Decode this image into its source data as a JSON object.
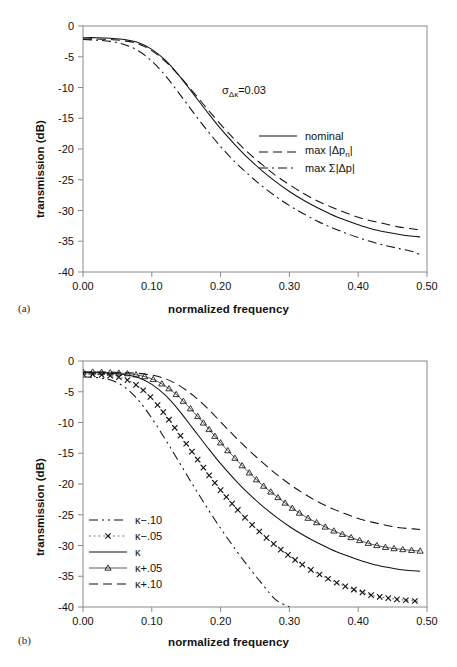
{
  "figure": {
    "panels": [
      {
        "id": "a",
        "panel_label": "(a)",
        "annotation_text": "=0.03",
        "annotation_symbol": "σ",
        "annotation_subscript": "Δκ"
      },
      {
        "id": "b",
        "panel_label": "(b)"
      }
    ]
  },
  "chart_data": [
    {
      "type": "line",
      "panel": "(a)",
      "title": "",
      "xlabel": "normalized frequency",
      "ylabel": "transmission (dB)",
      "xlim": [
        0.0,
        0.5
      ],
      "ylim": [
        -40,
        0
      ],
      "xticks": [
        "0.00",
        "0.10",
        "0.20",
        "0.30",
        "0.40",
        "0.50"
      ],
      "xtick_values": [
        0.0,
        0.1,
        0.2,
        0.3,
        0.4,
        0.5
      ],
      "yticks": [
        "0",
        "-5",
        "-10",
        "-15",
        "-20",
        "-25",
        "-30",
        "-35",
        "-40"
      ],
      "ytick_values": [
        0,
        -5,
        -10,
        -15,
        -20,
        -25,
        -30,
        -35,
        -40
      ],
      "grid": false,
      "legend_position": "center-right",
      "annotations": [
        {
          "text": "σΔκ=0.03",
          "x": 0.27,
          "y": -11.5
        }
      ],
      "x": [
        0.0,
        0.02,
        0.04,
        0.06,
        0.08,
        0.1,
        0.12,
        0.14,
        0.16,
        0.18,
        0.2,
        0.22,
        0.24,
        0.26,
        0.28,
        0.3,
        0.32,
        0.34,
        0.36,
        0.38,
        0.4,
        0.42,
        0.44,
        0.46,
        0.48,
        0.49
      ],
      "series": [
        {
          "name": "nominal",
          "style": "solid",
          "values": [
            -1.9,
            -1.9,
            -2.0,
            -2.2,
            -2.7,
            -3.8,
            -5.6,
            -8.1,
            -11.0,
            -13.9,
            -16.7,
            -19.2,
            -21.5,
            -23.5,
            -25.3,
            -26.9,
            -28.3,
            -29.5,
            -30.6,
            -31.5,
            -32.3,
            -33.0,
            -33.5,
            -33.9,
            -34.2,
            -34.3
          ]
        },
        {
          "name": "max |Δpₙ|",
          "style": "dashed",
          "values": [
            -2.1,
            -2.1,
            -2.2,
            -2.4,
            -2.9,
            -4.0,
            -5.8,
            -8.1,
            -10.7,
            -13.4,
            -16.0,
            -18.4,
            -20.6,
            -22.5,
            -24.3,
            -25.8,
            -27.2,
            -28.4,
            -29.4,
            -30.3,
            -31.1,
            -31.7,
            -32.2,
            -32.7,
            -33.0,
            -33.2
          ]
        },
        {
          "name": "max Σ|Δp|",
          "style": "dashdot",
          "values": [
            -2.2,
            -2.3,
            -2.5,
            -3.0,
            -4.0,
            -5.7,
            -8.1,
            -11.0,
            -14.0,
            -16.9,
            -19.6,
            -22.0,
            -24.1,
            -26.0,
            -27.7,
            -29.2,
            -30.5,
            -31.7,
            -32.7,
            -33.6,
            -34.4,
            -35.1,
            -35.7,
            -36.2,
            -36.7,
            -37.2
          ]
        }
      ]
    },
    {
      "type": "line",
      "panel": "(b)",
      "title": "",
      "xlabel": "normalized frequency",
      "ylabel": "transmission (dB)",
      "xlim": [
        0.0,
        0.5
      ],
      "ylim": [
        -40,
        0
      ],
      "xticks": [
        "0.00",
        "0.10",
        "0.20",
        "0.30",
        "0.40",
        "0.50"
      ],
      "xtick_values": [
        0.0,
        0.1,
        0.2,
        0.3,
        0.4,
        0.5
      ],
      "yticks": [
        "0",
        "-5",
        "-10",
        "-15",
        "-20",
        "-25",
        "-30",
        "-35",
        "-40"
      ],
      "ytick_values": [
        0,
        -5,
        -10,
        -15,
        -20,
        -25,
        -30,
        -35,
        -40
      ],
      "grid": false,
      "legend_position": "left-lower",
      "x": [
        0.0,
        0.02,
        0.04,
        0.06,
        0.08,
        0.1,
        0.12,
        0.14,
        0.16,
        0.18,
        0.2,
        0.22,
        0.24,
        0.26,
        0.28,
        0.3,
        0.32,
        0.34,
        0.36,
        0.38,
        0.4,
        0.42,
        0.44,
        0.46,
        0.48,
        0.49
      ],
      "series": [
        {
          "name": "κ−.10",
          "style": "dashdotdot",
          "marker": "none",
          "values": [
            -2.6,
            -2.7,
            -3.1,
            -4.2,
            -6.3,
            -9.3,
            -12.8,
            -16.5,
            -20.2,
            -23.8,
            -27.2,
            -30.4,
            -33.4,
            -36.2,
            -38.8,
            -40.0,
            null,
            null,
            null,
            null,
            null,
            null,
            null,
            null,
            null,
            null
          ]
        },
        {
          "name": "κ−.05",
          "style": "dotted",
          "marker": "cross",
          "values": [
            -2.1,
            -2.2,
            -2.4,
            -2.9,
            -4.1,
            -6.1,
            -8.8,
            -11.9,
            -15.0,
            -18.1,
            -21.0,
            -23.6,
            -26.0,
            -28.1,
            -30.0,
            -31.7,
            -33.2,
            -34.5,
            -35.6,
            -36.6,
            -37.4,
            -38.1,
            -38.5,
            -38.8,
            -39.0,
            -39.1
          ]
        },
        {
          "name": "κ",
          "style": "solid",
          "marker": "none",
          "values": [
            -1.9,
            -1.9,
            -2.0,
            -2.2,
            -2.7,
            -3.8,
            -5.6,
            -8.1,
            -11.0,
            -13.9,
            -16.7,
            -19.2,
            -21.5,
            -23.5,
            -25.3,
            -26.9,
            -28.3,
            -29.5,
            -30.6,
            -31.5,
            -32.3,
            -33.0,
            -33.5,
            -33.9,
            -34.1,
            -34.2
          ]
        },
        {
          "name": "κ+.05",
          "style": "solid",
          "marker": "triangle",
          "values": [
            -1.8,
            -1.8,
            -1.9,
            -2.0,
            -2.3,
            -2.9,
            -4.1,
            -5.9,
            -8.2,
            -10.7,
            -13.3,
            -15.7,
            -18.0,
            -20.1,
            -21.9,
            -23.6,
            -25.1,
            -26.3,
            -27.4,
            -28.3,
            -29.1,
            -29.8,
            -30.3,
            -30.6,
            -30.8,
            -30.9
          ]
        },
        {
          "name": "κ+.10",
          "style": "dashed",
          "marker": "none",
          "values": [
            -1.8,
            -1.8,
            -1.8,
            -1.9,
            -2.0,
            -2.3,
            -2.9,
            -4.0,
            -5.6,
            -7.6,
            -9.9,
            -12.2,
            -14.4,
            -16.4,
            -18.3,
            -20.0,
            -21.5,
            -22.8,
            -23.9,
            -24.8,
            -25.6,
            -26.2,
            -26.7,
            -27.1,
            -27.3,
            -27.4
          ]
        }
      ]
    }
  ]
}
